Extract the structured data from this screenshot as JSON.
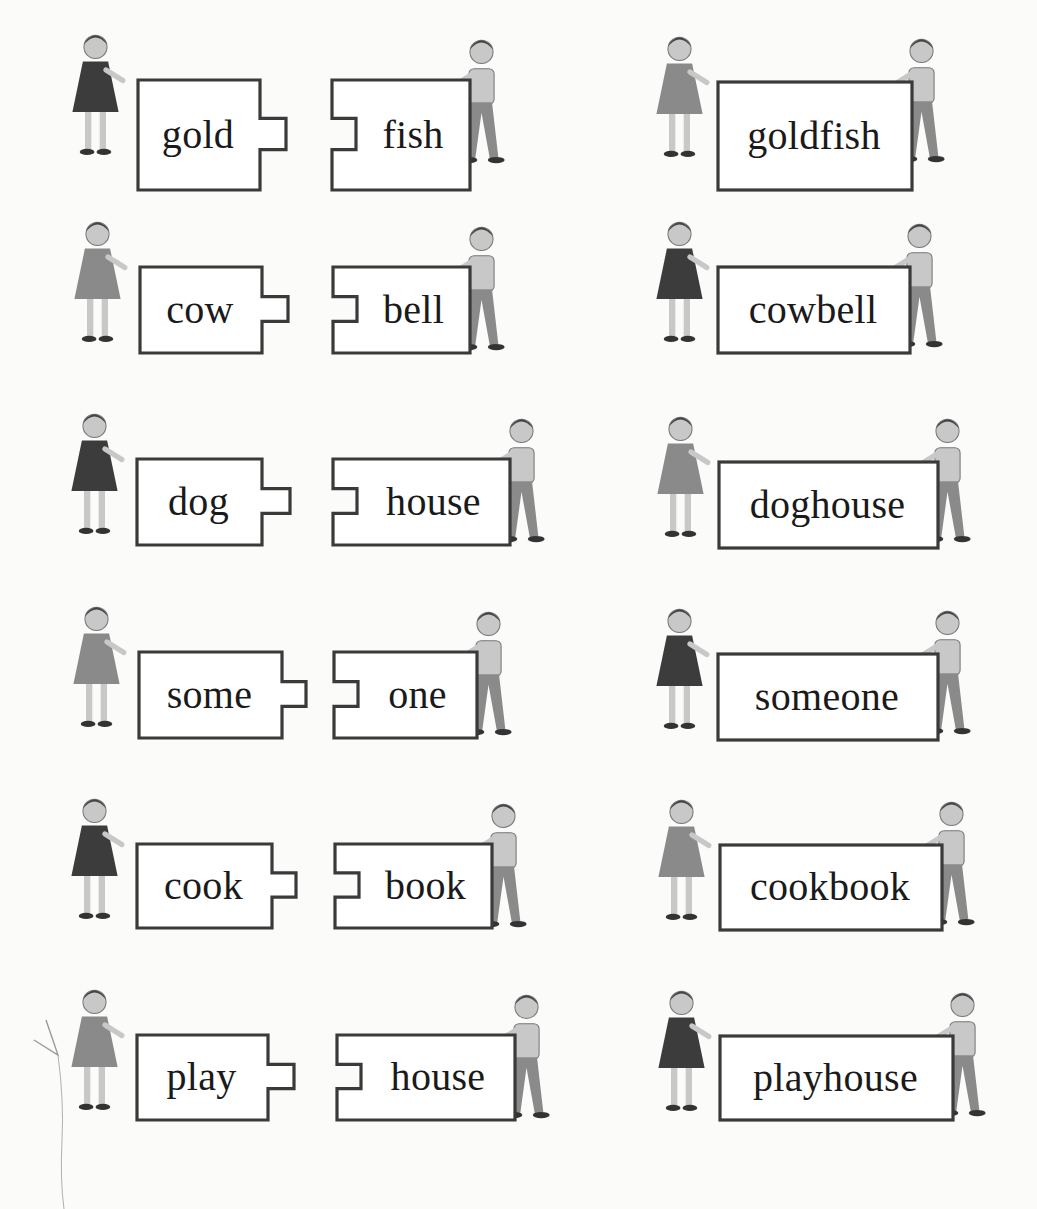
{
  "page": {
    "type": "compound-word puzzle illustration",
    "style": "grayscale children's reading workbook"
  },
  "rows": [
    {
      "first": "gold",
      "second": "fish",
      "compound": "goldfish"
    },
    {
      "first": "cow",
      "second": "bell",
      "compound": "cowbell"
    },
    {
      "first": "dog",
      "second": "house",
      "compound": "doghouse"
    },
    {
      "first": "some",
      "second": "one",
      "compound": "someone"
    },
    {
      "first": "cook",
      "second": "book",
      "compound": "cookbook"
    },
    {
      "first": "play",
      "second": "house",
      "compound": "playhouse"
    }
  ],
  "colors": {
    "background": "#fbfbfa",
    "box_border": "#3a3a3a",
    "box_fill": "#ffffff",
    "text": "#1a1a1a",
    "figure_dark": "#3c3c3c",
    "figure_mid": "#8a8a8a",
    "figure_light": "#c8c8c8"
  },
  "icons": {
    "left_piece": "puzzle-piece-tab-right",
    "right_piece": "puzzle-piece-notch-left",
    "compound_piece": "joined-card",
    "figure": "child-holding-card"
  }
}
